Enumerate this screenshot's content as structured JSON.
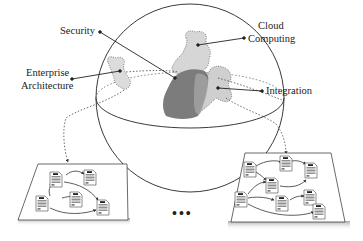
{
  "diagram": {
    "type": "conceptual-sphere-with-process-platforms",
    "labels": {
      "security": "Security",
      "cloud_line1": "Cloud",
      "cloud_line2": "Computing",
      "enterprise_line1": "Enterprise",
      "enterprise_line2": "Architecture",
      "integration": "Integration"
    },
    "ellipsis": "•••",
    "colors": {
      "sphere_stroke": "#3a3a3a",
      "blob_light": "#d9d9d9",
      "blob_medium": "#a9a9a9",
      "blob_dark": "#7c7c7c",
      "platform_fill": "#ffffff",
      "platform_shadow": "#bdbdbd",
      "leader_line": "#222222"
    },
    "platforms": [
      {
        "name": "left-process-platform",
        "document_count": 5
      },
      {
        "name": "right-process-platform",
        "document_count": 8
      }
    ]
  }
}
